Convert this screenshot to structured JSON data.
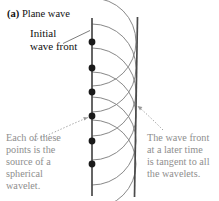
{
  "figure": {
    "panel_label": "(a)",
    "panel_title": " Plane wave"
  },
  "annotations": {
    "initial_front_line1": "Initial",
    "initial_front_line2": "wave front",
    "left_caption_line1": "Each of these",
    "left_caption_line2": "points is the",
    "left_caption_line3": "source of a",
    "left_caption_line4": "spherical",
    "left_caption_line5": "wavelet.",
    "right_caption_line1": "The wave front",
    "right_caption_line2": "at a later time",
    "right_caption_line3": "is tangent to all",
    "right_caption_line4": "the wavelets."
  },
  "colors": {
    "text_black": "#111111",
    "text_gray": "#8e8e8e",
    "line_dark": "#4a4a4a",
    "wavelet_gray": "#7b7b7b",
    "dot_black": "#1a1a1a",
    "leader_gray": "#9a9a9a",
    "background": "#ffffff"
  },
  "diagram": {
    "type": "huygens-plane-wave",
    "initial_front_line": {
      "x": 92,
      "y_top": 18,
      "y_bottom": 196
    },
    "later_front_line": {
      "x_top": 137,
      "y_top": 18,
      "x_bottom": 134,
      "y_bottom": 196
    },
    "source_points_y": [
      42,
      68,
      92,
      116,
      141,
      164
    ],
    "source_points_x": 92,
    "wavelet_radius": 44,
    "dot_radius": 3.4,
    "leader_initial_front": {
      "x1": 66,
      "y1": 42,
      "x2": 89,
      "y2": 30
    },
    "leader_left_caption": {
      "x1": 40,
      "y1": 136,
      "x2": 89,
      "y2": 117
    },
    "leader_right_caption": {
      "x1": 160,
      "y1": 131,
      "x2": 137,
      "y2": 106
    }
  }
}
